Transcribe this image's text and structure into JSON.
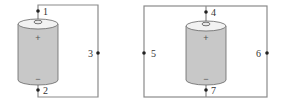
{
  "diagram": {
    "colors": {
      "wire": "#8a8a8a",
      "battery_body": "#c8c8c8",
      "battery_top": "#f2f2f2",
      "battery_outline": "#666666",
      "node": "#222222",
      "label": "#333333"
    },
    "circuits": [
      {
        "name": "left-circuit",
        "battery": {
          "positive_sign": "+",
          "negative_sign": "−"
        },
        "nodes": [
          {
            "id": "1",
            "label": "1",
            "position": "battery-top"
          },
          {
            "id": "2",
            "label": "2",
            "position": "battery-bottom"
          },
          {
            "id": "3",
            "label": "3",
            "position": "right-wire"
          }
        ]
      },
      {
        "name": "right-circuit",
        "battery": {
          "positive_sign": "+",
          "negative_sign": "−"
        },
        "nodes": [
          {
            "id": "4",
            "label": "4",
            "position": "battery-top"
          },
          {
            "id": "5",
            "label": "5",
            "position": "left-wire"
          },
          {
            "id": "6",
            "label": "6",
            "position": "right-wire"
          },
          {
            "id": "7",
            "label": "7",
            "position": "battery-bottom"
          }
        ]
      }
    ]
  }
}
